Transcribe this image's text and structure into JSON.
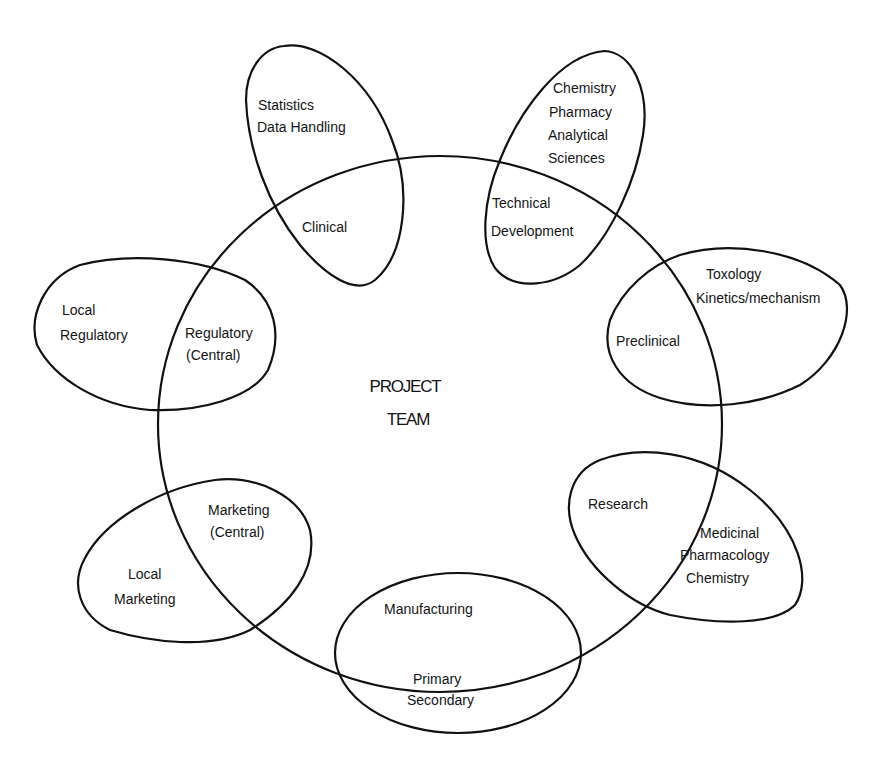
{
  "diagram": {
    "center": {
      "lines": [
        "PROJECT",
        "TEAM"
      ]
    },
    "groups": [
      {
        "id": "clinical",
        "inner_lines": [
          "Clinical"
        ],
        "outer_lines": [
          "Statistics",
          "Data Handling"
        ]
      },
      {
        "id": "technical-development",
        "inner_lines": [
          "Technical",
          "Development"
        ],
        "outer_lines": [
          "Chemistry",
          "Pharmacy",
          "Analytical",
          "Sciences"
        ]
      },
      {
        "id": "preclinical",
        "inner_lines": [
          "Preclinical"
        ],
        "outer_lines": [
          "Toxology",
          "Kinetics/mechanism"
        ]
      },
      {
        "id": "research",
        "inner_lines": [
          "Research"
        ],
        "outer_lines": [
          "Medicinal",
          "Pharmacology",
          "Chemistry"
        ]
      },
      {
        "id": "manufacturing",
        "inner_lines": [
          "Manufacturing"
        ],
        "outer_lines": [
          "Primary",
          "Secondary"
        ]
      },
      {
        "id": "marketing",
        "inner_lines": [
          "Marketing",
          "(Central)"
        ],
        "outer_lines": [
          "Local",
          "Marketing"
        ]
      },
      {
        "id": "regulatory",
        "inner_lines": [
          "Regulatory",
          "(Central)"
        ],
        "outer_lines": [
          "Local",
          "Regulatory"
        ]
      }
    ]
  }
}
